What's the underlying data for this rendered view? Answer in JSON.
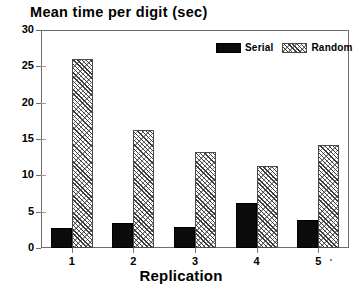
{
  "chart_data": {
    "type": "bar",
    "title": "Mean time per digit (sec)",
    "xlabel": "Replication",
    "ylabel": "",
    "categories": [
      "1",
      "2",
      "3",
      "4",
      "5"
    ],
    "series": [
      {
        "name": "Serial",
        "values": [
          2.8,
          3.4,
          2.9,
          6.2,
          3.9
        ],
        "color": "#0b0b0b",
        "fill": "solid"
      },
      {
        "name": "Random",
        "values": [
          26.0,
          16.2,
          13.2,
          11.3,
          14.2
        ],
        "color": "#3a3a3a",
        "fill": "diagonal-hatch"
      }
    ],
    "ylim": [
      0,
      30
    ],
    "yticks": [
      0,
      5,
      10,
      15,
      20,
      25,
      30
    ],
    "ytick_labels": [
      "0",
      "5",
      "10",
      "15",
      "20",
      "25",
      "30"
    ],
    "grid": false,
    "legend_position": "top-right"
  },
  "legend": {
    "entries": [
      {
        "label": "Serial"
      },
      {
        "label": "Random"
      }
    ]
  }
}
